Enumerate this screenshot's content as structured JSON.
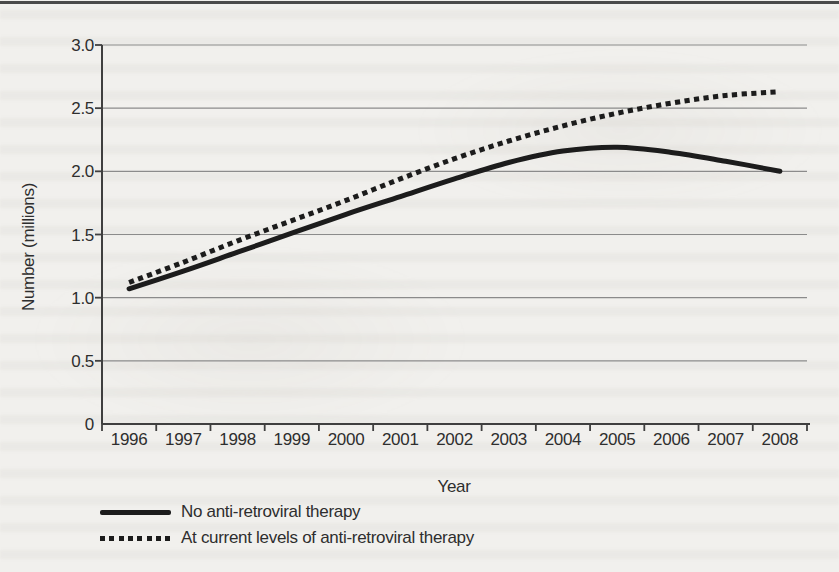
{
  "page": {
    "background_color": "#f1f0ed",
    "top_rule_color": "#4a4a4a"
  },
  "chart_data": {
    "type": "line",
    "title": "",
    "xlabel": "Year",
    "ylabel": "Number (millions)",
    "x": [
      1996,
      1997,
      1998,
      1999,
      2000,
      2001,
      2002,
      2003,
      2004,
      2005,
      2006,
      2007,
      2008
    ],
    "series": [
      {
        "name": "No anti-retroviral therapy",
        "style": "solid",
        "color": "#1c1c1c",
        "values": [
          1.07,
          1.21,
          1.36,
          1.51,
          1.66,
          1.8,
          1.94,
          2.07,
          2.16,
          2.19,
          2.15,
          2.08,
          2.0
        ]
      },
      {
        "name": "At current levels of anti-retroviral therapy",
        "style": "dotted",
        "color": "#1c1c1c",
        "values": [
          1.12,
          1.28,
          1.45,
          1.61,
          1.77,
          1.94,
          2.1,
          2.24,
          2.36,
          2.46,
          2.54,
          2.6,
          2.63
        ]
      }
    ],
    "ylim": [
      0,
      3.0
    ],
    "yticks": [
      0,
      0.5,
      1.0,
      1.5,
      2.0,
      2.5,
      3.0
    ],
    "ytick_labels": [
      "0",
      "0.5",
      "1.0",
      "1.5",
      "2.0",
      "2.5",
      "3.0"
    ],
    "grid": "horizontal",
    "grid_color": "#8b8b8b",
    "axis_color": "#3f3f3f",
    "label_color": "#2e2e2e",
    "legend_position": "bottom-left"
  }
}
